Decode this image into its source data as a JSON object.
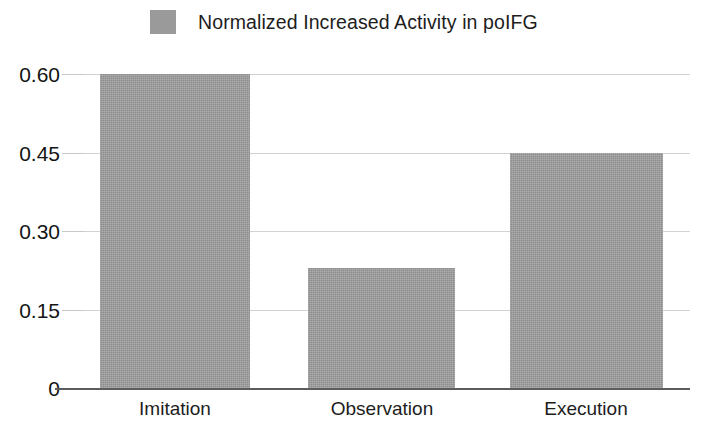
{
  "chart_data": {
    "type": "bar",
    "title": "",
    "categories": [
      "Imitation",
      "Observation",
      "Execution"
    ],
    "values": [
      0.6,
      0.23,
      0.45
    ],
    "series": [
      {
        "name": "Normalized Increased Activity in poIFG",
        "values": [
          0.6,
          0.23,
          0.45
        ]
      }
    ],
    "legend": {
      "position": "top",
      "entries": [
        {
          "label": "Normalized Increased Activity in poIFG",
          "color": "#9a9a9a"
        }
      ]
    },
    "xlabel": "",
    "ylabel": "",
    "ylim": [
      0,
      0.6
    ],
    "yticks": [
      "0",
      "0.15",
      "0.30",
      "0.45",
      "0.60"
    ],
    "ytick_values": [
      0,
      0.15,
      0.3,
      0.45,
      0.6
    ],
    "grid": true,
    "grid_axis": "y",
    "bar_color": "#9a9a9a",
    "gridline_color": "#d2d2d2",
    "baseline_color": "#5c5c5c",
    "text_color": "#1d1d1d"
  }
}
